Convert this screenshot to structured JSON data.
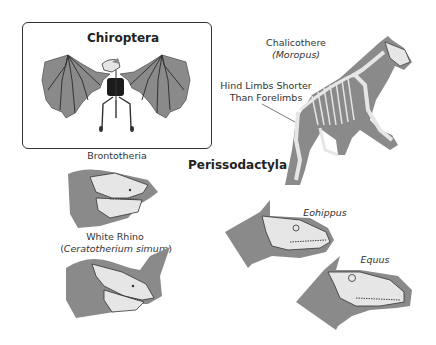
{
  "diagram": {
    "colors": {
      "silhouette": "#8a8a8a",
      "bone": "#e6e6e6",
      "outline": "#333333",
      "background": "#ffffff"
    },
    "inset": {
      "title": "Chiroptera",
      "animal": "bat skeleton"
    },
    "group_title": "Perissodactyla",
    "labels": {
      "chalicothere_common": "Chalicothere",
      "chalicothere_genus": "(Moropus)",
      "hind_limbs_line1": "Hind Limbs Shorter",
      "hind_limbs_line2": "Than Forelimbs",
      "brontotheria": "Brontotheria",
      "white_rhino_common": "White Rhino",
      "white_rhino_open": "(",
      "white_rhino_species": "Ceratotherium simum",
      "white_rhino_close": ")",
      "eohippus": "Eohippus",
      "equus": "Equus"
    }
  }
}
